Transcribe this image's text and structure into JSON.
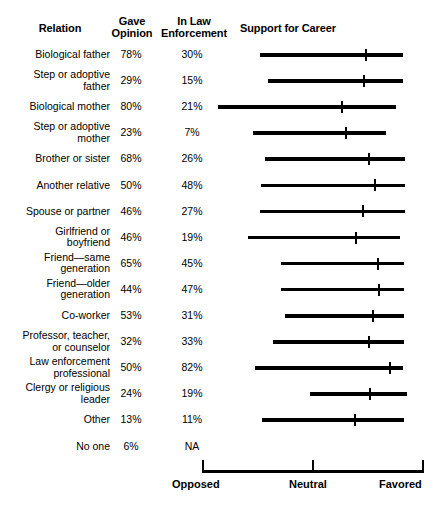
{
  "header": {
    "relation": "Relation",
    "gave_opinion": "Gave\nOpinion",
    "gave_opinion_l1": "Gave",
    "gave_opinion_l2": "Opinion",
    "in_law_enforcement_l1": "In Law",
    "in_law_enforcement_l2": "Enforcement",
    "support_for_career": "Support for Career"
  },
  "axis": {
    "left_label": "Opposed",
    "mid_label": "Neutral",
    "right_label": "Favored",
    "left_px": 202,
    "mid_px": 313,
    "right_px": 424
  },
  "rows": [
    {
      "label_l1": "Biological father",
      "label_l2": "",
      "gave": "78%",
      "law": "30%",
      "bar_start": 260,
      "bar_end": 403,
      "marker": 366
    },
    {
      "label_l1": "Step or adoptive",
      "label_l2": "father",
      "gave": "29%",
      "law": "15%",
      "bar_start": 268,
      "bar_end": 403,
      "marker": 364
    },
    {
      "label_l1": "Biological mother",
      "label_l2": "",
      "gave": "80%",
      "law": "21%",
      "bar_start": 218,
      "bar_end": 396,
      "marker": 342
    },
    {
      "label_l1": "Step or adoptive",
      "label_l2": "mother",
      "gave": "23%",
      "law": "7%",
      "bar_start": 253,
      "bar_end": 386,
      "marker": 346
    },
    {
      "label_l1": "Brother or sister",
      "label_l2": "",
      "gave": "68%",
      "law": "26%",
      "bar_start": 265,
      "bar_end": 405,
      "marker": 369
    },
    {
      "label_l1": "Another relative",
      "label_l2": "",
      "gave": "50%",
      "law": "48%",
      "bar_start": 261,
      "bar_end": 405,
      "marker": 375
    },
    {
      "label_l1": "Spouse or partner",
      "label_l2": "",
      "gave": "46%",
      "law": "27%",
      "bar_start": 260,
      "bar_end": 405,
      "marker": 363
    },
    {
      "label_l1": "Girlfriend or",
      "label_l2": "boyfriend",
      "gave": "46%",
      "law": "19%",
      "bar_start": 248,
      "bar_end": 400,
      "marker": 356
    },
    {
      "label_l1": "Friend—same",
      "label_l2": "generation",
      "gave": "65%",
      "law": "45%",
      "bar_start": 281,
      "bar_end": 404,
      "marker": 378
    },
    {
      "label_l1": "Friend—older",
      "label_l2": "generation",
      "gave": "44%",
      "law": "47%",
      "bar_start": 281,
      "bar_end": 404,
      "marker": 379
    },
    {
      "label_l1": "Co-worker",
      "label_l2": "",
      "gave": "53%",
      "law": "31%",
      "bar_start": 285,
      "bar_end": 404,
      "marker": 373
    },
    {
      "label_l1": "Professor, teacher,",
      "label_l2": "or counselor",
      "gave": "32%",
      "law": "33%",
      "bar_start": 273,
      "bar_end": 404,
      "marker": 369
    },
    {
      "label_l1": "Law enforcement",
      "label_l2": "professional",
      "gave": "50%",
      "law": "82%",
      "bar_start": 255,
      "bar_end": 403,
      "marker": 390
    },
    {
      "label_l1": "Clergy or religious",
      "label_l2": "leader",
      "gave": "24%",
      "law": "19%",
      "bar_start": 310,
      "bar_end": 407,
      "marker": 370
    },
    {
      "label_l1": "Other",
      "label_l2": "",
      "gave": "13%",
      "law": "11%",
      "bar_start": 262,
      "bar_end": 404,
      "marker": 355
    },
    {
      "label_l1": "No one",
      "label_l2": "",
      "gave": "6%",
      "law": "NA",
      "bar_start": null,
      "bar_end": null,
      "marker": null
    }
  ],
  "chart_data": {
    "type": "bar",
    "title": "Support for Career",
    "xlabel": "",
    "ylabel": "Relation",
    "grid": false,
    "legend": "none",
    "axis_ticks": [
      "Opposed",
      "Neutral",
      "Favored"
    ],
    "axis_tick_values": [
      0,
      50,
      100
    ],
    "xlim": [
      0,
      100
    ],
    "categories": [
      "Biological father",
      "Step or adoptive father",
      "Biological mother",
      "Step or adoptive mother",
      "Brother or sister",
      "Another relative",
      "Spouse or partner",
      "Girlfriend or boyfriend",
      "Friend—same generation",
      "Friend—older generation",
      "Co-worker",
      "Professor, teacher, or counselor",
      "Law enforcement professional",
      "Clergy or religious leader",
      "Other",
      "No one"
    ],
    "series": [
      {
        "name": "Gave Opinion",
        "units": "percent",
        "values": [
          78,
          29,
          80,
          23,
          68,
          50,
          46,
          46,
          65,
          44,
          53,
          32,
          50,
          24,
          13,
          6
        ]
      },
      {
        "name": "In Law Enforcement",
        "units": "percent",
        "values": [
          30,
          15,
          21,
          7,
          26,
          48,
          27,
          19,
          45,
          47,
          31,
          33,
          82,
          19,
          11,
          null
        ]
      },
      {
        "name": "Support for Career (range low, 0-100 scale)",
        "units": "scale",
        "values": [
          26,
          30,
          7,
          23,
          28,
          27,
          26,
          21,
          36,
          36,
          37,
          32,
          24,
          49,
          27,
          null
        ]
      },
      {
        "name": "Support for Career (range high, 0-100 scale)",
        "units": "scale",
        "values": [
          90,
          90,
          87,
          83,
          91,
          91,
          91,
          89,
          91,
          91,
          91,
          91,
          90,
          92,
          91,
          null
        ]
      },
      {
        "name": "Support for Career (mean marker, 0-100 scale)",
        "units": "scale",
        "values": [
          74,
          73,
          63,
          65,
          75,
          78,
          73,
          69,
          79,
          80,
          77,
          75,
          85,
          76,
          69,
          null
        ]
      }
    ]
  }
}
